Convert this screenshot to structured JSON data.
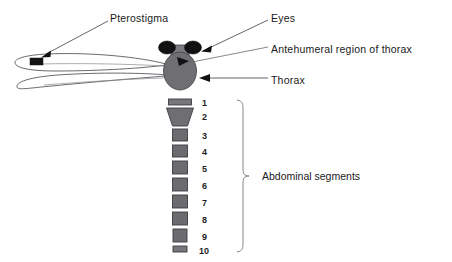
{
  "figure": {
    "background_color": "#ffffff"
  },
  "colors": {
    "body_gray": "#6e6e73",
    "body_gray_dark": "#5a5a5f",
    "eye_black": "#111111",
    "segment_gray": "#6b6b70",
    "outline": "#3f3f44",
    "leader_line": "#55545a",
    "brace": "#7a7a80",
    "text": "#1a1a1a",
    "wing_fill": "#ffffff"
  },
  "labels": [
    {
      "id": "pterostigma",
      "text": "Pterostigma",
      "x": 110,
      "y": 22,
      "anchor": "start"
    },
    {
      "id": "eyes",
      "text": "Eyes",
      "x": 271,
      "y": 22,
      "anchor": "start"
    },
    {
      "id": "antehumeral",
      "text": "Antehumeral region of thorax",
      "x": 271,
      "y": 53,
      "anchor": "start"
    },
    {
      "id": "thorax",
      "text": "Thorax",
      "x": 271,
      "y": 84,
      "anchor": "start"
    },
    {
      "id": "abdominal-segments",
      "text": "Abdominal segments",
      "x": 262,
      "y": 180,
      "anchor": "start"
    }
  ],
  "abdominal_segments": {
    "count": 10,
    "numbers": [
      "1",
      "2",
      "3",
      "4",
      "5",
      "6",
      "7",
      "8",
      "9",
      "10"
    ],
    "number_column_x": 202,
    "items": [
      {
        "number": "1",
        "shape": "bar",
        "cx": 180,
        "y": 100,
        "width": 23,
        "height": 6,
        "label_y": 105
      },
      {
        "number": "2",
        "shape": "trapezoid",
        "cx": 180,
        "y": 108,
        "width": 27,
        "height": 17,
        "label_y": 117,
        "bottom_width": 15
      },
      {
        "number": "3",
        "shape": "rect",
        "cx": 180,
        "y": 129,
        "width": 15,
        "height": 12,
        "label_y": 136
      },
      {
        "number": "4",
        "shape": "rect",
        "cx": 180,
        "y": 145,
        "width": 15,
        "height": 12,
        "label_y": 152
      },
      {
        "number": "5",
        "shape": "rect",
        "cx": 180,
        "y": 161,
        "width": 15,
        "height": 13,
        "label_y": 169
      },
      {
        "number": "6",
        "shape": "rect",
        "cx": 180,
        "y": 178,
        "width": 15,
        "height": 13,
        "label_y": 186
      },
      {
        "number": "7",
        "shape": "rect",
        "cx": 180,
        "y": 195,
        "width": 15,
        "height": 13,
        "label_y": 203
      },
      {
        "number": "8",
        "shape": "rect",
        "cx": 180,
        "y": 212,
        "width": 15,
        "height": 13,
        "label_y": 220
      },
      {
        "number": "9",
        "shape": "rect",
        "cx": 180,
        "y": 229,
        "width": 14,
        "height": 13,
        "label_y": 237
      },
      {
        "number": "10",
        "shape": "bar",
        "cx": 180,
        "y": 246,
        "width": 14,
        "height": 6,
        "label_y": 251
      }
    ]
  },
  "body_parts": {
    "left_eye": {
      "cx": 168,
      "cy": 48,
      "rx": 8,
      "ry": 6
    },
    "right_eye": {
      "cx": 192,
      "cy": 48,
      "rx": 8,
      "ry": 6
    },
    "head_plate": {
      "x": 171,
      "y": 47,
      "width": 18,
      "height": 11
    },
    "thorax": {
      "cx": 180,
      "cy": 70,
      "rx": 16,
      "ry": 18
    },
    "antehumeral_marker": {
      "shape": "triangle"
    },
    "pterostigma_mark": {
      "x": 30,
      "y": 58,
      "width": 13,
      "height": 7
    }
  },
  "wings": {
    "count": 2,
    "upper": {
      "tip_x": 18,
      "base_x": 166,
      "y": 62
    },
    "lower": {
      "tip_x": 18,
      "base_x": 166,
      "y": 80
    }
  },
  "brace": {
    "x": 240,
    "top_y": 100,
    "bottom_y": 252,
    "tip_x": 250,
    "mid_y": 176
  }
}
